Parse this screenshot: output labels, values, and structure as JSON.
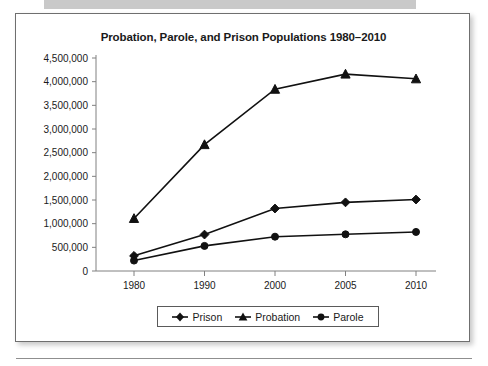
{
  "card": {
    "title": "Probation, Parole, and Prison Populations 1980–2010"
  },
  "legend": {
    "entries": [
      {
        "label": "Prison",
        "marker": "diamond-marker-icon"
      },
      {
        "label": "Probation",
        "marker": "triangle-marker-icon"
      },
      {
        "label": "Parole",
        "marker": "circle-marker-icon"
      }
    ]
  },
  "axis": {
    "y_tick_labels": [
      "4,500,000",
      "4,000,000",
      "3,500,000",
      "3,000,000",
      "2,500,000",
      "2,000,000",
      "1,500,000",
      "1,000,000",
      "500,000",
      "0"
    ],
    "x_tick_labels": [
      "1980",
      "1990",
      "2000",
      "2005",
      "2010"
    ]
  },
  "colors": {
    "ink": "#111111",
    "axis": "#808080",
    "card_border": "#6f6f6f",
    "top_band": "#c9c9c9"
  },
  "chart_data": {
    "type": "line",
    "title": "Probation, Parole, and Prison Populations 1980–2010",
    "xlabel": "",
    "ylabel": "",
    "categories": [
      "1980",
      "1990",
      "2000",
      "2005",
      "2010"
    ],
    "ylim": [
      0,
      4500000
    ],
    "ytick_step": 500000,
    "grid": false,
    "legend_position": "bottom",
    "series": [
      {
        "name": "Prison",
        "marker": "diamond",
        "values": [
          320000,
          770000,
          1320000,
          1450000,
          1510000
        ]
      },
      {
        "name": "Probation",
        "marker": "triangle",
        "values": [
          1110000,
          2670000,
          3840000,
          4160000,
          4060000
        ]
      },
      {
        "name": "Parole",
        "marker": "circle",
        "values": [
          220000,
          530000,
          725000,
          775000,
          825000
        ]
      }
    ]
  }
}
